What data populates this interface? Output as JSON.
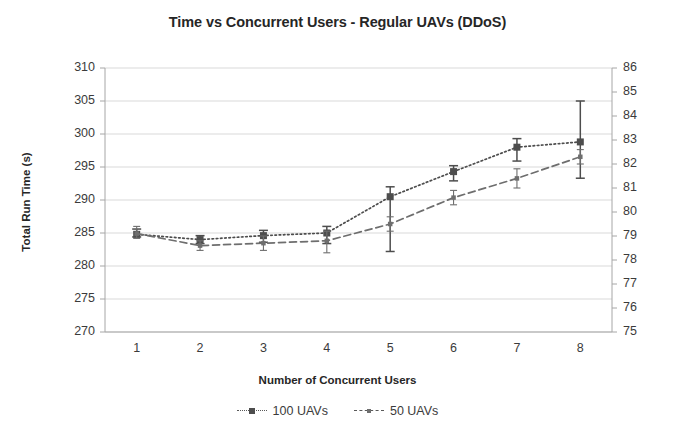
{
  "chart_data": {
    "type": "line",
    "title": "Time vs Concurrent Users - Regular UAVs (DDoS)",
    "xlabel": "Number of Concurrent Users",
    "ylabel": "Total Run Time (s)",
    "y2label": "",
    "x": [
      1,
      2,
      3,
      4,
      5,
      6,
      7,
      8
    ],
    "xticks": [
      "1",
      "2",
      "3",
      "4",
      "5",
      "6",
      "7",
      "8"
    ],
    "yticks_left": [
      "310",
      "305",
      "300",
      "295",
      "290",
      "285",
      "280",
      "275",
      "270"
    ],
    "yticks_right": [
      "86",
      "85",
      "84",
      "83",
      "82",
      "81",
      "80",
      "79",
      "78",
      "77",
      "76",
      "75"
    ],
    "ylim": [
      270,
      310
    ],
    "y2lim": [
      75,
      86
    ],
    "grid": true,
    "legend_position": "bottom",
    "series": [
      {
        "name": "100 UAVs",
        "axis": "left",
        "linestyle": "dotted",
        "marker": "square",
        "color": "#4d4d4d",
        "values": [
          284.8,
          284.0,
          284.6,
          285.0,
          290.5,
          294.3,
          298.0,
          298.8
        ],
        "err_low": [
          284.4,
          283.4,
          283.6,
          283.4,
          282.2,
          292.9,
          295.9,
          293.3
        ],
        "err_high": [
          285.6,
          284.6,
          285.4,
          286.0,
          292.0,
          295.2,
          299.3,
          305.0
        ]
      },
      {
        "name": "50 UAVs",
        "axis": "right",
        "linestyle": "dashed",
        "marker": "small-square",
        "color": "#6e6e6e",
        "values": [
          79.1,
          78.6,
          78.7,
          78.8,
          79.5,
          80.6,
          81.4,
          82.3
        ],
        "err_low": [
          78.9,
          78.4,
          78.4,
          78.3,
          79.2,
          80.3,
          81.0,
          82.0
        ],
        "err_high": [
          79.4,
          78.8,
          79.0,
          79.2,
          79.8,
          80.9,
          81.8,
          82.6
        ]
      }
    ]
  },
  "legend": {
    "entries": [
      {
        "label": "100 UAVs"
      },
      {
        "label": "50 UAVs"
      }
    ]
  },
  "colors": {
    "series_100": "#4d4d4d",
    "series_50": "#6e6e6e",
    "grid": "#d9d9d9",
    "axis": "#a6a6a6",
    "text": "#262626"
  }
}
